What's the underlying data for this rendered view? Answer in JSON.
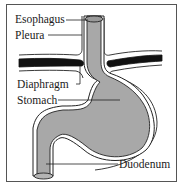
{
  "diagram": {
    "type": "anatomical",
    "subject": "stomach",
    "labels": {
      "esophagus": "Esophagus",
      "pleura": "Pleura",
      "diaphragm": "Diaphragm",
      "stomach": "Stomach",
      "duodenum": "Duodenum"
    },
    "colors": {
      "organ_fill": "#a8a8a8",
      "diaphragm": "#111111",
      "outline": "#222222",
      "frame": "#555555",
      "background": "#ffffff"
    }
  }
}
